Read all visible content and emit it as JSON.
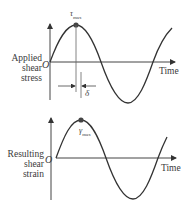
{
  "diagram": {
    "top_plot": {
      "ylabel_lines": [
        "Applied",
        "shear",
        "stress"
      ],
      "xlabel": "Time",
      "origin_label": "O",
      "peak_symbol": "τ",
      "peak_subscript": "max",
      "phase_symbol": "δ"
    },
    "bottom_plot": {
      "ylabel_lines": [
        "Resulting",
        "shear",
        "strain"
      ],
      "xlabel": "Time",
      "origin_label": "O",
      "peak_symbol": "γ",
      "peak_subscript": "max"
    },
    "colors": {
      "line": "#333333",
      "guide": "#555555",
      "marker": "#444444"
    }
  }
}
